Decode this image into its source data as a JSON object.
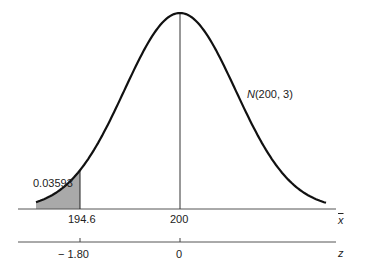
{
  "chart_data": {
    "type": "area",
    "title": "",
    "distribution_label": "N(200, 3)",
    "distribution": {
      "mean": 200,
      "sd": 3
    },
    "shaded_region": {
      "from": "-inf",
      "to": 194.6,
      "area": 0.03593,
      "area_label": "0.03593"
    },
    "x_axis": {
      "label": "x̄",
      "ticks": [
        {
          "value": 194.6,
          "label": "194.6"
        },
        {
          "value": 200,
          "label": "200"
        }
      ]
    },
    "z_axis": {
      "label": "z",
      "ticks": [
        {
          "value": -1.8,
          "label": "− 1.80"
        },
        {
          "value": 0,
          "label": "0"
        }
      ]
    },
    "mean_line": true,
    "grid": false,
    "legend": "none"
  },
  "labels": {
    "area": "0.03593",
    "dist_pre": "N",
    "dist_post": "(200, 3)",
    "x_tick_1": "194.6",
    "x_tick_2": "200",
    "x_axis": "x",
    "z_tick_1": "− 1.80",
    "z_tick_2": "0",
    "z_axis": "z"
  },
  "colors": {
    "curve": "#111111",
    "shade": "#a9a9a9",
    "axis": "#444444"
  }
}
